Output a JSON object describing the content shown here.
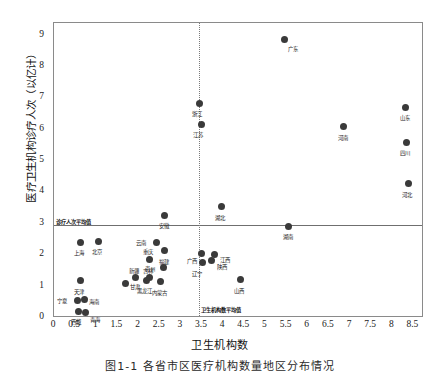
{
  "chart_data": {
    "type": "scatter",
    "title": "",
    "caption": "图1-1  各省市区医疗机构数量地区分布情况",
    "xlabel": "卫生机构数",
    "ylabel": "医疗卫生机构诊疗人次（以亿计）",
    "xlim": [
      0,
      8.75
    ],
    "ylim": [
      0,
      9.4
    ],
    "xticks": [
      0,
      0.5,
      1,
      1.5,
      2,
      2.5,
      3,
      3.5,
      4,
      4.5,
      5,
      5.5,
      6,
      6.5,
      7,
      7.5,
      8,
      8.5
    ],
    "xtick_labels": [
      "0",
      "0.5",
      "1",
      "1.5",
      "2",
      "2.5",
      "3",
      "3.5",
      "4",
      "4.5",
      "5",
      "5.5",
      "6",
      "6.5",
      "7",
      "7.5",
      "8",
      "8.5"
    ],
    "yticks": [
      0,
      1,
      2,
      3,
      4,
      5,
      6,
      7,
      8,
      9
    ],
    "ytick_labels": [
      "0",
      "1",
      "2",
      "3",
      "4",
      "5",
      "6",
      "7",
      "8",
      "9"
    ],
    "grid": false,
    "legend": "none",
    "marker_color": "#3a3a3a",
    "reference_lines": [
      {
        "id": "mean-visits",
        "orientation": "horizontal",
        "value": 2.95,
        "label": "诊疗人次平均值",
        "style": "solid"
      },
      {
        "id": "mean-institutions",
        "orientation": "vertical",
        "value": 3.42,
        "label": "卫生机构数平均值",
        "style": "dotted"
      }
    ],
    "points": [
      {
        "name": "广东",
        "x": 5.45,
        "y": 8.88,
        "lx": 4,
        "ly": 8
      },
      {
        "name": "浙江",
        "x": 3.45,
        "y": 6.82,
        "lx": -8,
        "ly": 8
      },
      {
        "name": "江苏",
        "x": 3.48,
        "y": 6.15,
        "lx": -8,
        "ly": 8
      },
      {
        "name": "山东",
        "x": 8.32,
        "y": 6.72,
        "lx": -6,
        "ly": 9
      },
      {
        "name": "河南",
        "x": 6.85,
        "y": 6.1,
        "lx": -6,
        "ly": 9
      },
      {
        "name": "四川",
        "x": 8.33,
        "y": 5.6,
        "lx": -6,
        "ly": 9
      },
      {
        "name": "河北",
        "x": 8.38,
        "y": 4.28,
        "lx": -6,
        "ly": 9
      },
      {
        "name": "湖北",
        "x": 3.95,
        "y": 3.55,
        "lx": -6,
        "ly": 9
      },
      {
        "name": "安徽",
        "x": 2.62,
        "y": 3.28,
        "lx": -6,
        "ly": 9
      },
      {
        "name": "湖南",
        "x": 5.55,
        "y": 2.92,
        "lx": -6,
        "ly": 9
      },
      {
        "name": "上海",
        "x": 0.62,
        "y": 2.42,
        "lx": -6,
        "ly": 9
      },
      {
        "name": "北京",
        "x": 1.05,
        "y": 2.45,
        "lx": -6,
        "ly": 9
      },
      {
        "name": "云南",
        "x": 2.42,
        "y": 2.4,
        "lx": -20,
        "ly": -2
      },
      {
        "name": "福建",
        "x": 2.62,
        "y": 2.14,
        "lx": -6,
        "ly": 9
      },
      {
        "name": "广西",
        "x": 3.48,
        "y": 2.05,
        "lx": -14,
        "ly": 5
      },
      {
        "name": "江西",
        "x": 3.8,
        "y": 2.02,
        "lx": 5,
        "ly": 3
      },
      {
        "name": "陕西",
        "x": 3.72,
        "y": 1.82,
        "lx": 6,
        "ly": 4
      },
      {
        "name": "辽宁",
        "x": 3.5,
        "y": 1.78,
        "lx": -10,
        "ly": 10
      },
      {
        "name": "重庆",
        "x": 2.25,
        "y": 1.88,
        "lx": -6,
        "ly": -9
      },
      {
        "name": "贵州",
        "x": 2.58,
        "y": 1.6,
        "lx": -18,
        "ly": -1
      },
      {
        "name": "山西",
        "x": 4.4,
        "y": 1.22,
        "lx": -6,
        "ly": 9
      },
      {
        "name": "新疆",
        "x": 1.92,
        "y": 1.28,
        "lx": -6,
        "ly": -9
      },
      {
        "name": "吉林",
        "x": 2.25,
        "y": 1.28,
        "lx": -6,
        "ly": -9
      },
      {
        "name": "黑龙江",
        "x": 2.18,
        "y": 1.2,
        "lx": -9,
        "ly": 9
      },
      {
        "name": "内蒙古",
        "x": 2.52,
        "y": 1.16,
        "lx": -9,
        "ly": 9
      },
      {
        "name": "天津",
        "x": 0.62,
        "y": 1.18,
        "lx": -6,
        "ly": 9
      },
      {
        "name": "甘肃",
        "x": 1.68,
        "y": 1.1,
        "lx": 5,
        "ly": 2
      },
      {
        "name": "宁夏",
        "x": 0.55,
        "y": 0.55,
        "lx": -20,
        "ly": -2
      },
      {
        "name": "海南",
        "x": 0.72,
        "y": 0.58,
        "lx": 5,
        "ly": 0
      },
      {
        "name": "西藏",
        "x": 0.58,
        "y": 0.22,
        "lx": -8,
        "ly": 9
      },
      {
        "name": "青海",
        "x": 0.75,
        "y": 0.18,
        "lx": 4,
        "ly": 6
      }
    ]
  }
}
